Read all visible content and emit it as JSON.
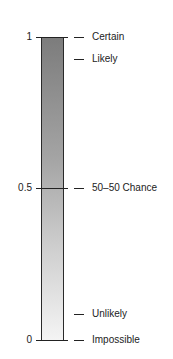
{
  "diagram": {
    "type": "probability-scale",
    "gradient": {
      "top_color": "#7c7c7c",
      "bottom_color": "#f4f4f4"
    },
    "axis_ticks": [
      {
        "value": "1",
        "y": 37
      },
      {
        "value": "0.5",
        "y": 188
      },
      {
        "value": "0",
        "y": 340
      }
    ],
    "labels": [
      {
        "text": "Certain",
        "y": 37
      },
      {
        "text": "Likely",
        "y": 59
      },
      {
        "text": "50–50 Chance",
        "y": 188
      },
      {
        "text": "Unlikely",
        "y": 314
      },
      {
        "text": "Impossible",
        "y": 340
      }
    ]
  }
}
